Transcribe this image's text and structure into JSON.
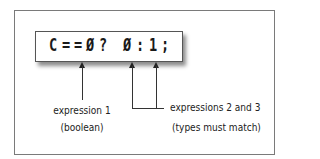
{
  "diagram": {
    "code": {
      "chars": [
        "C",
        "=",
        "=",
        "Ø",
        "?",
        "Ø",
        ":",
        "1",
        ";"
      ],
      "full_text": "C==Ø? Ø:1;"
    },
    "labels": {
      "expr1_line1": "expression 1",
      "expr1_line2": "(boolean)",
      "expr23_line1": "expressions 2 and 3",
      "expr23_line2": "(types must match)"
    }
  }
}
